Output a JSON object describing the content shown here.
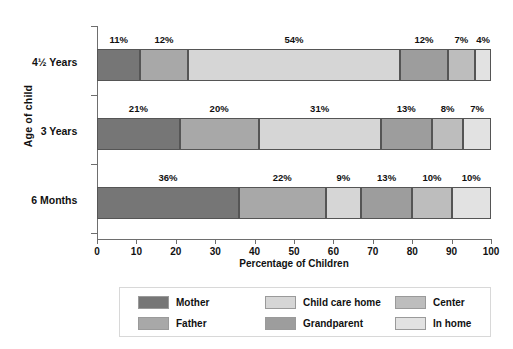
{
  "chart_data": {
    "type": "bar",
    "orientation": "horizontal",
    "stacked": true,
    "stack_mode": "percent",
    "title": "",
    "xlabel": "Percentage of Children",
    "ylabel": "Age of child",
    "xlim": [
      0,
      100
    ],
    "xticks": [
      0,
      10,
      20,
      30,
      40,
      50,
      60,
      70,
      80,
      90,
      100
    ],
    "xtick_labels": [
      "0",
      "10",
      "20",
      "30",
      "40",
      "50",
      "60",
      "70",
      "80",
      "90",
      "100"
    ],
    "grid": false,
    "legend_position": "bottom",
    "categories": [
      "4½ Years",
      "3 Years",
      "6 Months"
    ],
    "series": [
      {
        "name": "Mother",
        "color": "#767676",
        "values": [
          11,
          21,
          36
        ]
      },
      {
        "name": "Father",
        "color": "#a8a8a8",
        "values": [
          12,
          20,
          22
        ]
      },
      {
        "name": "Child care home",
        "color": "#d6d6d6",
        "values": [
          54,
          31,
          9
        ]
      },
      {
        "name": "Grandparent",
        "color": "#9d9d9d",
        "values": [
          12,
          13,
          13
        ]
      },
      {
        "name": "Center",
        "color": "#bdbdbd",
        "values": [
          7,
          8,
          10
        ]
      },
      {
        "name": "In home",
        "color": "#e2e2e2",
        "values": [
          4,
          7,
          10
        ]
      }
    ],
    "bar_labels": [
      [
        "11%",
        "12%",
        "54%",
        "12%",
        "7%",
        "4%"
      ],
      [
        "21%",
        "20%",
        "31%",
        "13%",
        "8%",
        "7%"
      ],
      [
        "36%",
        "22%",
        "9%",
        "13%",
        "10%",
        "10%"
      ]
    ]
  }
}
